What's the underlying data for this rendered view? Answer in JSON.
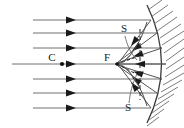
{
  "figure": {
    "kind": "optics-ray-diagram",
    "background_color": "#ffffff",
    "line_color": "#555555",
    "dark_line_color": "#1a1a1a",
    "caustic_color": "#6b6b6b",
    "hatch_color": "#777777",
    "width": 184,
    "height": 128
  },
  "labels": {
    "center_of_curvature": "C",
    "focus": "F",
    "caustic_upper": "S",
    "caustic_lower": "S"
  },
  "label_positions": {
    "center_of_curvature": {
      "x": 52,
      "y": 60
    },
    "focus": {
      "x": 106,
      "y": 60
    },
    "caustic_upper": {
      "x": 124,
      "y": 30
    },
    "caustic_lower": {
      "x": 128,
      "y": 108
    }
  },
  "points": {
    "C": {
      "x": 62,
      "y": 64
    },
    "F": {
      "x": 117,
      "y": 64
    }
  },
  "axis": {
    "y": 64,
    "x_start": 12,
    "x_end": 160
  },
  "incident_rays": [
    {
      "y": 20,
      "x_start": 33,
      "x_end": 152,
      "arrow_x": 74
    },
    {
      "y": 33,
      "x_start": 33,
      "x_end": 158,
      "arrow_x": 74
    },
    {
      "y": 48,
      "x_start": 33,
      "x_end": 163,
      "arrow_x": 74
    },
    {
      "y": 64,
      "x_start": 12,
      "x_end": 166,
      "arrow_x": 74
    },
    {
      "y": 79,
      "x_start": 33,
      "x_end": 163,
      "arrow_x": 74
    },
    {
      "y": 93,
      "x_start": 33,
      "x_end": 158,
      "arrow_x": 74
    },
    {
      "y": 108,
      "x_start": 33,
      "x_end": 152,
      "arrow_x": 74
    }
  ],
  "mirror": {
    "shape": "concave-arc",
    "apex": {
      "x": 166,
      "y": 64
    },
    "top": {
      "x": 147,
      "y": 6
    },
    "bottom": {
      "x": 147,
      "y": 122
    },
    "hatching": "back-side"
  },
  "dashed_line": {
    "x": 140,
    "y_top": 28,
    "y_bottom": 102
  },
  "reflected_rays": [
    {
      "from_x": 152,
      "from_y": 20,
      "to_x": 120,
      "to_y": 62
    },
    {
      "from_x": 158,
      "from_y": 33,
      "to_x": 118,
      "to_y": 62
    },
    {
      "from_x": 163,
      "from_y": 48,
      "to_x": 117,
      "to_y": 63
    },
    {
      "from_x": 166,
      "from_y": 64,
      "to_x": 117,
      "to_y": 64
    },
    {
      "from_x": 163,
      "from_y": 79,
      "to_x": 117,
      "to_y": 65
    },
    {
      "from_x": 158,
      "from_y": 93,
      "to_x": 118,
      "to_y": 66
    },
    {
      "from_x": 152,
      "from_y": 108,
      "to_x": 120,
      "to_y": 66
    }
  ],
  "caustic_curves": {
    "description": "Two S-shaped caustic branches meeting in a cusp at the focus",
    "upper_label_leader": "from S label down to caustic branch",
    "lower_label_leader": "from S label up to caustic branch"
  }
}
